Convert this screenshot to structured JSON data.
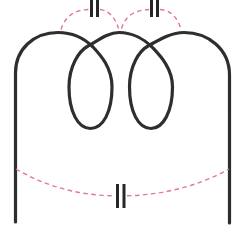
{
  "diagram": {
    "canvas": {
      "width": 242,
      "height": 231
    },
    "colors": {
      "bg": "#ffffff",
      "coil": "#2e2e2e",
      "cap": "#e0798f",
      "plate": "#262626"
    },
    "coil": {
      "turns": 2,
      "path": "M 15.5 222 L 15.5 73 C 15.5 49 34 32.5 58 32.5 C 74 32.5 86 40 93 47 C 101 55.5 112 68 112 87 C 112 112 103 128.5 90.5 128.5 C 78 128.5 69 112 69 87 C 69 66 79 51 88 46 C 98 40.5 108 32.5 119 32.5 C 133 32.5 145 40 152 47 C 160 55.5 172.5 68 172.5 87 C 172.5 112 163 128.5 151 128.5 C 138.5 128.5 129.5 112 129.5 87 C 129.5 66 139 51 148 46 C 158 40.5 170 32.5 184 32.5 C 208 32.5 229.5 49 229.5 75 L 229.5 223"
    },
    "links": {
      "top_left": {
        "arc_a": "M 61 29.5 C 64.5 18 73 9.5 89.5 9.5",
        "arc_b": "M 100 9.5 C 110 10.5 115.5 19 118.5 28.5",
        "plate_a": "M 91.5 0 L 91.5 17",
        "plate_b": "M 97.5 0 L 97.5 17"
      },
      "top_right": {
        "arc_a": "M 121.5 28.5 C 124.5 19 130.5 10.5 149 9.5",
        "arc_b": "M 160 9.5 C 170.5 10 177.5 17.5 181 29",
        "plate_a": "M 151.5 0 L 151.5 17",
        "plate_b": "M 157.5 0 L 157.5 17"
      },
      "bottom": {
        "arc_a": "M 16 169 C 45 186 78 195.5 115 195.8",
        "arc_b": "M 127 195.8 C 163 195 200 185.5 229 169",
        "plate_a": "M 117.5 184 L 117.5 208",
        "plate_b": "M 124 184 L 124 208"
      }
    }
  }
}
